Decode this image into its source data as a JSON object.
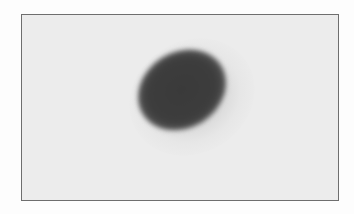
{
  "image": {
    "description": "Grayscale scan of a single dark elliptical spot on a light background inside a thin bordered frame",
    "colors": {
      "background": "#fdfdfd",
      "frame_fill": "#ececec",
      "frame_border": "#6e6e6e",
      "spot": "#3a3a3a"
    },
    "spot": {
      "shape": "ellipse",
      "orientation": "tilted up-right"
    }
  }
}
